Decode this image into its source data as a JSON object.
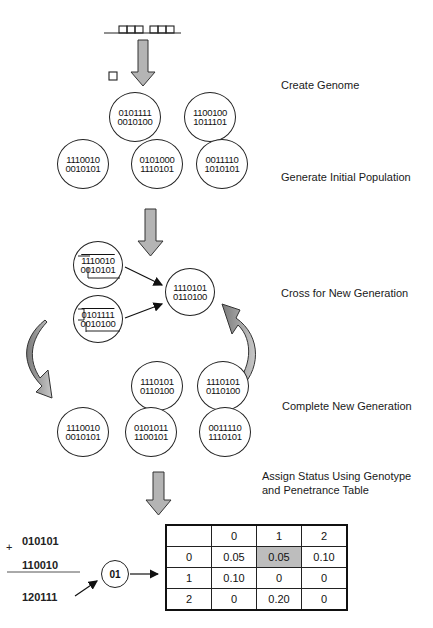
{
  "steps": {
    "create_genome": "Create Genome",
    "generate_population": "Generate Initial Population",
    "cross": "Cross for New Generation",
    "complete": "Complete New Generation",
    "assign_line1": "Assign Status Using Genotype",
    "assign_line2": "and Penetrance Table"
  },
  "initial_population": [
    {
      "top": "0101111",
      "bottom": "0010100"
    },
    {
      "top": "1100100",
      "bottom": "1011101"
    },
    {
      "top": "1110010",
      "bottom": "0010101"
    },
    {
      "top": "0101000",
      "bottom": "1110101"
    },
    {
      "top": "0011110",
      "bottom": "1010101"
    }
  ],
  "cross": {
    "parent1": {
      "top": "1110010",
      "bottom": "0010101"
    },
    "parent2": {
      "top": "0101111",
      "bottom": "0010100"
    },
    "offspring": {
      "top": "1110101",
      "bottom": "0110100"
    }
  },
  "new_generation": [
    {
      "top": "1110101",
      "bottom": "0110100"
    },
    {
      "top": "1110101",
      "bottom": "0110100"
    },
    {
      "top": "1110010",
      "bottom": "0010101"
    },
    {
      "top": "0101011",
      "bottom": "1100101"
    },
    {
      "top": "0011110",
      "bottom": "1110101"
    }
  ],
  "status_calc": {
    "plus_sign": "+",
    "line1": "010101",
    "line2": "110010",
    "sum": "120111",
    "genotype": "01"
  },
  "penetrance_table": {
    "col_headers": [
      "",
      "0",
      "1",
      "2"
    ],
    "rows": [
      [
        "0",
        "0.05",
        "0.05",
        "0.10"
      ],
      [
        "1",
        "0.10",
        "0",
        "0"
      ],
      [
        "2",
        "0",
        "0.20",
        "0"
      ]
    ],
    "highlight": {
      "row": 0,
      "col": 2,
      "color": "#bdbdbd"
    }
  },
  "colors": {
    "arrow_fill": "#b4b4b4",
    "curved_arrow_dark": "#8a8a8a",
    "stroke": "#222222"
  }
}
